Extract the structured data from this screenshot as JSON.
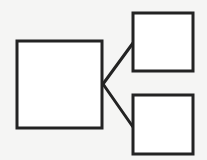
{
  "diagram": {
    "type": "tree",
    "background": "#f5f5f4",
    "stroke_color": "#232323",
    "fill_color": "#ffffff",
    "stroke_width": 3,
    "nodes": [
      {
        "id": "root",
        "label": "",
        "x": 17,
        "y": 41,
        "width": 85,
        "height": 87
      },
      {
        "id": "child-top",
        "label": "",
        "x": 133,
        "y": 13,
        "width": 60,
        "height": 58
      },
      {
        "id": "child-bottom",
        "label": "",
        "x": 133,
        "y": 95,
        "width": 60,
        "height": 59
      }
    ],
    "edges": [
      {
        "from": "root",
        "to": "child-top",
        "x1": 103,
        "y1": 84,
        "x2": 133,
        "y2": 43
      },
      {
        "from": "root",
        "to": "child-bottom",
        "x1": 103,
        "y1": 84,
        "x2": 133,
        "y2": 127
      }
    ]
  }
}
